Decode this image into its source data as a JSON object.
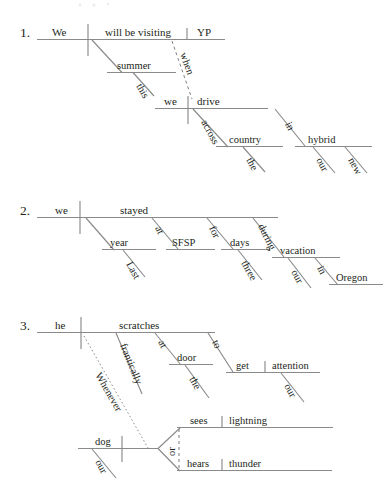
{
  "page": {
    "background_color": "#ffffff",
    "line_color": "#8a8a8a",
    "text_color": "#231f20",
    "width": 390,
    "height": 498
  },
  "diagrams": [
    {
      "number": "1.",
      "sentence": "We will be visiting YP this summer when we drive across the country in our new hybrid.",
      "labels": {
        "subject": "We",
        "verb": "will be visiting",
        "object": "YP",
        "mod_summer": "summer",
        "mod_this": "this",
        "conjunction": "when",
        "sub_subject": "we",
        "sub_verb": "drive",
        "prep_across": "across",
        "obj_country": "country",
        "mod_the": "the",
        "prep_in": "in",
        "obj_hybrid": "hybrid",
        "mod_our": "our",
        "mod_new": "new"
      }
    },
    {
      "number": "2.",
      "sentence": "Last year we stayed at SFSP for three days during our vacation in Oregon.",
      "labels": {
        "subject": "we",
        "verb": "stayed",
        "mod_last": "Last",
        "obj_year": "year",
        "prep_at": "at",
        "obj_sfsp": "SFSP",
        "prep_for": "for",
        "obj_days": "days",
        "mod_three": "three",
        "prep_during": "during",
        "obj_vacation": "vacation",
        "mod_our": "our",
        "prep_in": "in",
        "obj_oregon": "Oregon"
      }
    },
    {
      "number": "3.",
      "sentence": "Whenever our dog sees lightning or hears thunder, he scratches frantically at the door to get our attention.",
      "labels": {
        "subject": "he",
        "verb": "scratches",
        "mod_frantically": "frantically",
        "prep_at": "at",
        "obj_door": "door",
        "mod_the": "the",
        "prep_to": "to",
        "inf_verb": "get",
        "inf_object": "attention",
        "mod_our": "our",
        "conjunction": "Whenever",
        "sub_mod_our": "our",
        "sub_subject": "dog",
        "coord_conj": "or",
        "branch_a_verb": "sees",
        "branch_a_object": "lightning",
        "branch_b_verb": "hears",
        "branch_b_object": "thunder"
      }
    }
  ]
}
